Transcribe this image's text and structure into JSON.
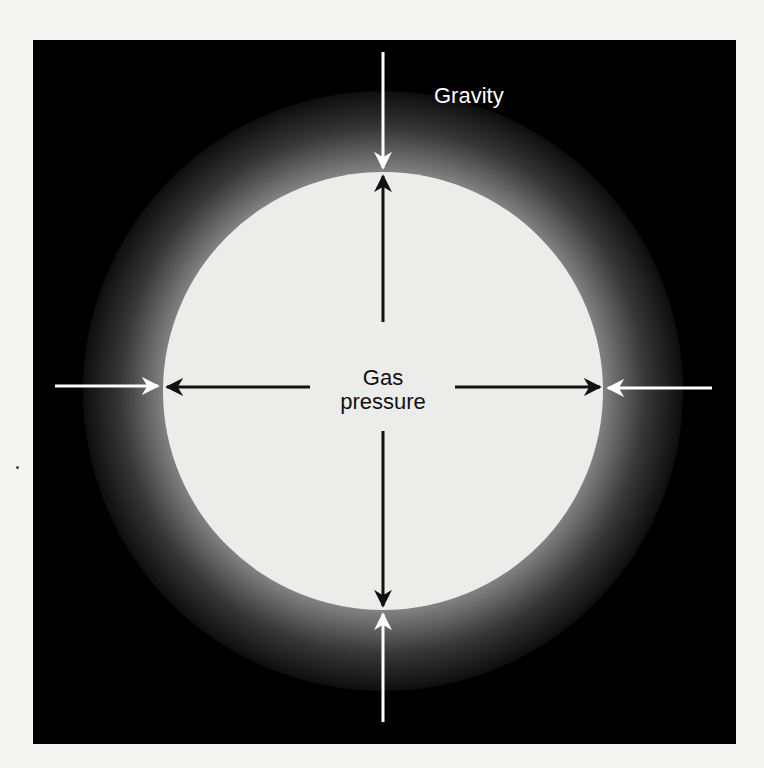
{
  "diagram": {
    "labels": {
      "gravity": "Gravity",
      "gas_pressure_line1": "Gas",
      "gas_pressure_line2": "pressure"
    },
    "colors": {
      "background": "#000000",
      "star": "#ececea",
      "gravity_arrow": "#ffffff",
      "pressure_arrow": "#111111",
      "page": "#f4f4f2"
    },
    "arrows": {
      "gravity": [
        {
          "direction": "down",
          "from": [
            383,
            52
          ],
          "to": [
            383,
            170
          ]
        },
        {
          "direction": "up",
          "from": [
            383,
            722
          ],
          "to": [
            383,
            612
          ]
        },
        {
          "direction": "right",
          "from": [
            55,
            386
          ],
          "to": [
            160,
            386
          ]
        },
        {
          "direction": "left",
          "from": [
            712,
            388
          ],
          "to": [
            606,
            388
          ]
        }
      ],
      "gas_pressure": [
        {
          "direction": "up",
          "from": [
            383,
            320
          ],
          "to": [
            383,
            174
          ]
        },
        {
          "direction": "down",
          "from": [
            383,
            430
          ],
          "to": [
            383,
            608
          ]
        },
        {
          "direction": "left",
          "from": [
            310,
            387
          ],
          "to": [
            165,
            387
          ]
        },
        {
          "direction": "right",
          "from": [
            455,
            387
          ],
          "to": [
            602,
            387
          ]
        }
      ]
    }
  }
}
